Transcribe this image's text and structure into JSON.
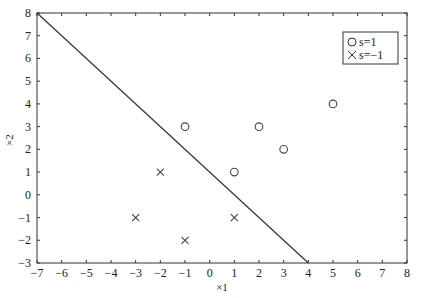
{
  "chart_data": {
    "type": "scatter",
    "title": "",
    "xlabel": "x1",
    "ylabel": "x2",
    "xlim": [
      -7,
      8
    ],
    "ylim": [
      -3,
      8
    ],
    "grid": false,
    "legend_position": "upper right",
    "x_ticks": [
      -7,
      -6,
      -5,
      -4,
      -3,
      -2,
      -1,
      0,
      1,
      2,
      3,
      4,
      5,
      6,
      7,
      8
    ],
    "y_ticks": [
      -3,
      -2,
      -1,
      0,
      1,
      2,
      3,
      4,
      5,
      6,
      7,
      8
    ],
    "series": [
      {
        "name": "s=1",
        "marker": "circle",
        "points": [
          [
            -1,
            3
          ],
          [
            2,
            3
          ],
          [
            3,
            2
          ],
          [
            1,
            1
          ],
          [
            5,
            4
          ]
        ]
      },
      {
        "name": "s=−1",
        "marker": "cross",
        "points": [
          [
            -2,
            1
          ],
          [
            -3,
            -1
          ],
          [
            -1,
            -2
          ],
          [
            1,
            -1
          ]
        ]
      }
    ],
    "lines": [
      {
        "name": "decision-boundary",
        "from": [
          -7,
          8
        ],
        "to": [
          4,
          -3
        ]
      }
    ],
    "colors": {
      "axis": "#333333",
      "marker": "#444444",
      "line": "#333333"
    }
  },
  "labels": {
    "xlabel": "×1",
    "ylabel": "×2",
    "legend": [
      "s=1",
      "s=−1"
    ]
  }
}
